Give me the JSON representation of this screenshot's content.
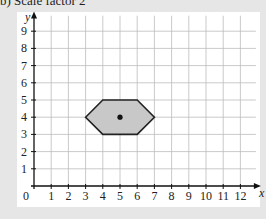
{
  "header": {
    "text": "b)  Scale factor 2"
  },
  "chart_data": {
    "type": "diagram",
    "title": "Scale factor 2",
    "xlabel": "x",
    "ylabel": "y",
    "xlim": [
      0,
      12
    ],
    "ylim": [
      0,
      9
    ],
    "x_ticks": [
      "1",
      "2",
      "3",
      "4",
      "5",
      "6",
      "7",
      "8",
      "9",
      "10",
      "11",
      "12"
    ],
    "y_ticks": [
      "1",
      "2",
      "3",
      "4",
      "5",
      "6",
      "7",
      "8",
      "9"
    ],
    "origin_label": "0",
    "grid": true,
    "shape": {
      "name": "hexagon",
      "vertices": [
        [
          3,
          4
        ],
        [
          4,
          5
        ],
        [
          6,
          5
        ],
        [
          7,
          4
        ],
        [
          6,
          3
        ],
        [
          4,
          3
        ]
      ],
      "fill": "#c8c8c8",
      "stroke": "#222222"
    },
    "centre_of_enlargement": [
      5,
      4
    ]
  }
}
